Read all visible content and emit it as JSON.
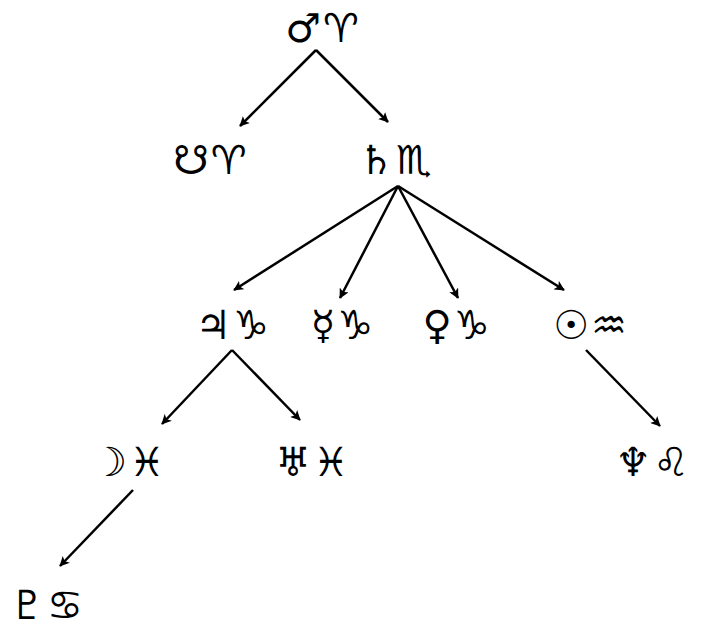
{
  "diagram": {
    "type": "tree",
    "colors": {
      "ink": "#000000",
      "background": "#ffffff"
    },
    "nodes": [
      {
        "id": "mars_aries",
        "planet": "♂",
        "planet_name": "Mars",
        "sign": "♈",
        "sign_name": "Aries",
        "x": 322,
        "y": 28
      },
      {
        "id": "node_aries",
        "planet": "☋",
        "planet_name": "South Node",
        "sign": "♈",
        "sign_name": "Aries",
        "x": 210,
        "y": 160
      },
      {
        "id": "saturn_scorpio",
        "planet": "♄",
        "planet_name": "Saturn",
        "sign": "♏",
        "sign_name": "Scorpio",
        "x": 395,
        "y": 160
      },
      {
        "id": "jupiter_capricorn",
        "planet": "♃",
        "planet_name": "Jupiter",
        "sign": "♑",
        "sign_name": "Capricorn",
        "x": 232,
        "y": 325
      },
      {
        "id": "mercury_capricorn",
        "planet": "☿",
        "planet_name": "Mercury",
        "sign": "♑",
        "sign_name": "Capricorn",
        "x": 342,
        "y": 325
      },
      {
        "id": "venus_capricorn",
        "planet": "♀",
        "planet_name": "Venus",
        "sign": "♑",
        "sign_name": "Capricorn",
        "x": 456,
        "y": 325
      },
      {
        "id": "sun_aquarius",
        "planet": "☉",
        "planet_name": "Sun",
        "sign": "♒",
        "sign_name": "Aquarius",
        "x": 590,
        "y": 325
      },
      {
        "id": "moon_pisces",
        "planet": "☽",
        "planet_name": "Moon",
        "sign": "♓",
        "sign_name": "Pisces",
        "x": 128,
        "y": 462
      },
      {
        "id": "uranus_pisces",
        "planet": "♅",
        "planet_name": "Uranus",
        "sign": "♓",
        "sign_name": "Pisces",
        "x": 312,
        "y": 462
      },
      {
        "id": "neptune_leo",
        "planet": "♆",
        "planet_name": "Neptune",
        "sign": "♌",
        "sign_name": "Leo",
        "x": 652,
        "y": 462
      },
      {
        "id": "pluto_cancer",
        "planet": "♇",
        "planet_name": "Pluto",
        "sign": "♋",
        "sign_name": "Cancer",
        "x": 46,
        "y": 605
      }
    ],
    "edges": [
      {
        "from": "mars_aries",
        "to": "node_aries",
        "x1": 316,
        "y1": 50,
        "x2": 240,
        "y2": 126
      },
      {
        "from": "mars_aries",
        "to": "saturn_scorpio",
        "x1": 316,
        "y1": 50,
        "x2": 388,
        "y2": 122
      },
      {
        "from": "saturn_scorpio",
        "to": "jupiter_capricorn",
        "x1": 398,
        "y1": 186,
        "x2": 234,
        "y2": 290
      },
      {
        "from": "saturn_scorpio",
        "to": "mercury_capricorn",
        "x1": 398,
        "y1": 186,
        "x2": 340,
        "y2": 298
      },
      {
        "from": "saturn_scorpio",
        "to": "venus_capricorn",
        "x1": 398,
        "y1": 186,
        "x2": 458,
        "y2": 298
      },
      {
        "from": "saturn_scorpio",
        "to": "sun_aquarius",
        "x1": 398,
        "y1": 186,
        "x2": 564,
        "y2": 290
      },
      {
        "from": "jupiter_capricorn",
        "to": "moon_pisces",
        "x1": 232,
        "y1": 350,
        "x2": 162,
        "y2": 424
      },
      {
        "from": "jupiter_capricorn",
        "to": "uranus_pisces",
        "x1": 232,
        "y1": 350,
        "x2": 300,
        "y2": 420
      },
      {
        "from": "sun_aquarius",
        "to": "neptune_leo",
        "x1": 586,
        "y1": 350,
        "x2": 660,
        "y2": 426
      },
      {
        "from": "moon_pisces",
        "to": "pluto_cancer",
        "x1": 133,
        "y1": 490,
        "x2": 60,
        "y2": 566
      }
    ]
  }
}
